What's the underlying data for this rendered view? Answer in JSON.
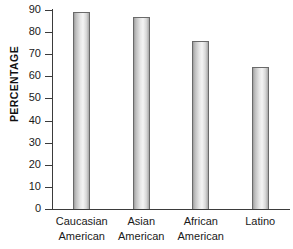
{
  "chart_data": {
    "type": "bar",
    "title": "",
    "subtitle": "",
    "xlabel": "",
    "ylabel": "PERCENTAGE",
    "categories": [
      "Caucasian American",
      "Asian American",
      "African American",
      "Latino"
    ],
    "category_lines": [
      [
        "Caucasian",
        "American"
      ],
      [
        "Asian",
        "American"
      ],
      [
        "African",
        "American"
      ],
      [
        "Latino",
        ""
      ]
    ],
    "values": [
      89,
      87,
      76,
      64
    ],
    "ylim": [
      0,
      90
    ],
    "ytick_values": [
      90,
      80,
      70,
      60,
      50,
      40,
      30,
      20,
      10,
      0
    ],
    "ytick_labels": [
      "90",
      "80",
      "70",
      "60",
      "50",
      "40",
      "30",
      "20",
      "10",
      "0"
    ],
    "ytick_step": 10,
    "grid": false,
    "legend": null,
    "legend_position": "none",
    "annotations": [],
    "colors": {
      "bar_fill_light": "#f4f4f4",
      "bar_fill_mid": "#d9d9d9",
      "bar_fill_dark": "#9d9d9d",
      "bar_border": "#6a6a6a",
      "axis": "#3b3b3b",
      "text": "#1a1a1a",
      "background": "#ffffff"
    }
  }
}
